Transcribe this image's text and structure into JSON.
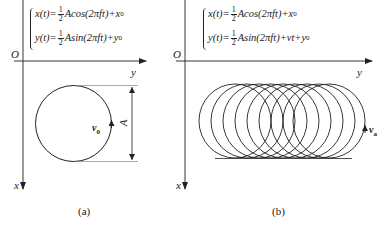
{
  "panels": [
    {
      "id": "a",
      "caption": "(a)",
      "origin_label": "O",
      "x_axis_label": "x",
      "y_axis_label": "y",
      "equations": {
        "x": {
          "lhs": "x(t)=",
          "frac_num": "1",
          "frac_den": "2",
          "rhs": "Acos(2πft)+x",
          "sub": "0"
        },
        "y": {
          "lhs": "y(t)=",
          "frac_num": "1",
          "frac_den": "2",
          "rhs": "Asin(2πft)+y",
          "sub": "0"
        }
      },
      "velocity_label": "v",
      "velocity_sub": "0",
      "dimension_label": "A",
      "shape": "single circle"
    },
    {
      "id": "b",
      "caption": "(b)",
      "origin_label": "O",
      "x_axis_label": "x",
      "y_axis_label": "y",
      "equations": {
        "x": {
          "lhs": "x(t)=",
          "frac_num": "1",
          "frac_den": "2",
          "rhs": "Acos(2πft)+x",
          "sub": "0"
        },
        "y": {
          "lhs": "y(t)=",
          "frac_num": "1",
          "frac_den": "2",
          "rhs": "Asin(2πft)+vt+y",
          "sub": "0"
        }
      },
      "velocity_label": "v",
      "velocity_sub": "a",
      "shape": "trochoid loops (9 overlapping circles)"
    }
  ],
  "colors": {
    "line": "#222222",
    "background": "#ffffff"
  }
}
